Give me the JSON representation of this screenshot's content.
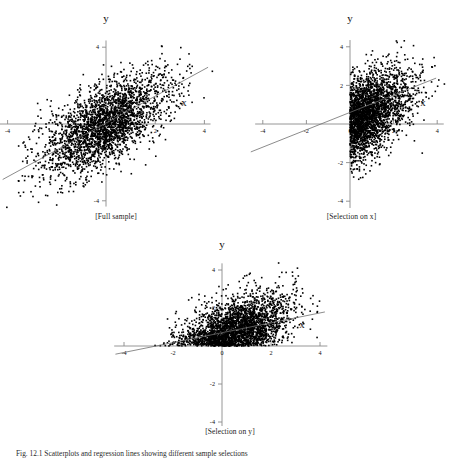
{
  "figure": {
    "caption_bottom": "Fig. 12.1 Scatterplots and regression lines showing different sample selections",
    "panels": [
      {
        "id": "full-sample",
        "caption": "[Full sample]",
        "xlabel": "x",
        "ylabel": "y",
        "x_ticks": [
          -4,
          2,
          4
        ],
        "x_tick_labels": [
          "-4",
          "2",
          "4"
        ],
        "y_ticks": [
          4,
          -4
        ],
        "y_tick_labels": [
          "4",
          "-4"
        ],
        "axis_color": "#8a8a8a",
        "point_color": "#000000",
        "line_color": "#6f6f6f"
      },
      {
        "id": "selection-on-x",
        "caption": "[Selection on x]",
        "xlabel": "x",
        "ylabel": "y",
        "x_ticks": [
          -4,
          -2,
          0,
          2,
          4
        ],
        "x_tick_labels": [
          "-4",
          "-2",
          "0",
          "2",
          "4"
        ],
        "y_ticks": [
          4,
          2,
          0,
          -2,
          -4
        ],
        "y_tick_labels": [
          "4",
          "2",
          "0",
          "-2",
          "-4"
        ],
        "axis_color": "#8a8a8a",
        "point_color": "#000000",
        "line_color": "#6f6f6f"
      },
      {
        "id": "selection-on-y",
        "caption": "[Selection on y]",
        "xlabel": "x",
        "ylabel": "y",
        "x_ticks": [
          -4,
          -2,
          0,
          2,
          4
        ],
        "x_tick_labels": [
          "-4",
          "-2",
          "0",
          "2",
          "4"
        ],
        "y_ticks": [
          4,
          2,
          -2,
          -4
        ],
        "y_tick_labels": [
          "4",
          "2",
          "-2",
          "-4"
        ],
        "axis_color": "#8a8a8a",
        "point_color": "#000000",
        "line_color": "#6f6f6f"
      }
    ]
  },
  "chart_data": [
    {
      "type": "scatter",
      "title": "[Full sample]",
      "xlabel": "x",
      "ylabel": "y",
      "xlim": [
        -5.0,
        5.0
      ],
      "ylim": [
        -5.0,
        5.0
      ],
      "xticks": [
        -4,
        2,
        4
      ],
      "yticks": [
        4,
        -4
      ],
      "grid": false,
      "legend": "none",
      "n_points": 2800,
      "selection": "none",
      "correlation": 0.62,
      "series": [
        {
          "name": "observations",
          "distribution": "bivariate normal",
          "mean": [
            0,
            0
          ],
          "sd": [
            1.25,
            1.25
          ],
          "rho": 0.62
        },
        {
          "name": "regression line",
          "type": "line",
          "slope": 0.62,
          "intercept": 0.0,
          "x_from": -4.3,
          "x_to": 4.3
        }
      ]
    },
    {
      "type": "scatter",
      "title": "[Selection on x]",
      "xlabel": "x",
      "ylabel": "y",
      "xlim": [
        -5.0,
        5.0
      ],
      "ylim": [
        -5.0,
        5.0
      ],
      "xticks": [
        -4,
        -2,
        0,
        2,
        4
      ],
      "yticks": [
        4,
        2,
        0,
        -2,
        -4
      ],
      "grid": false,
      "legend": "none",
      "n_points": 1400,
      "selection": "x >= 0",
      "correlation": 0.45,
      "series": [
        {
          "name": "observations",
          "distribution": "bivariate normal truncated at x >= 0",
          "mean": [
            0,
            0
          ],
          "sd": [
            1.25,
            1.25
          ],
          "rho": 0.62
        },
        {
          "name": "regression line",
          "type": "line",
          "slope": 0.45,
          "intercept": 0.55,
          "x_from": -4.6,
          "x_to": 3.9
        }
      ]
    },
    {
      "type": "scatter",
      "title": "[Selection on y]",
      "xlabel": "x",
      "ylabel": "y",
      "xlim": [
        -5.0,
        5.0
      ],
      "ylim": [
        -5.0,
        5.0
      ],
      "xticks": [
        -4,
        -2,
        0,
        2,
        4
      ],
      "yticks": [
        4,
        2,
        -2,
        -4
      ],
      "grid": false,
      "legend": "none",
      "n_points": 1400,
      "selection": "y >= 0",
      "correlation": 0.28,
      "series": [
        {
          "name": "observations",
          "distribution": "bivariate normal truncated at y >= 0",
          "mean": [
            0,
            0
          ],
          "sd": [
            1.25,
            1.25
          ],
          "rho": 0.62
        },
        {
          "name": "regression line",
          "type": "line",
          "slope": 0.27,
          "intercept": 0.62,
          "x_from": -4.4,
          "x_to": 4.2
        }
      ]
    }
  ]
}
